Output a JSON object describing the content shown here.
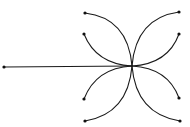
{
  "diagram": {
    "width": 190,
    "height": 127,
    "background": "#ffffff",
    "stroke_color": "#1a1a1a",
    "node_color": "#111111",
    "center": {
      "x": 132,
      "y": 66
    },
    "stem": {
      "from": {
        "x": 4,
        "y": 67
      },
      "to": {
        "x": 132,
        "y": 66
      }
    },
    "arcs": [
      {
        "id": "top-left-outer",
        "end": {
          "x": 85,
          "y": 13
        },
        "ctrl": {
          "x": 128,
          "y": 18
        }
      },
      {
        "id": "top-left-inner",
        "end": {
          "x": 84,
          "y": 34
        },
        "ctrl": {
          "x": 96,
          "y": 64
        }
      },
      {
        "id": "top-right-outer",
        "end": {
          "x": 179,
          "y": 12
        },
        "ctrl": {
          "x": 136,
          "y": 18
        }
      },
      {
        "id": "top-right-inner",
        "end": {
          "x": 179,
          "y": 34
        },
        "ctrl": {
          "x": 168,
          "y": 64
        }
      },
      {
        "id": "bottom-left-inner",
        "end": {
          "x": 84,
          "y": 99
        },
        "ctrl": {
          "x": 96,
          "y": 68
        }
      },
      {
        "id": "bottom-left-outer",
        "end": {
          "x": 85,
          "y": 121
        },
        "ctrl": {
          "x": 128,
          "y": 114
        }
      },
      {
        "id": "bottom-right-inner",
        "end": {
          "x": 179,
          "y": 98
        },
        "ctrl": {
          "x": 168,
          "y": 68
        }
      },
      {
        "id": "bottom-right-outer",
        "end": {
          "x": 180,
          "y": 121
        },
        "ctrl": {
          "x": 136,
          "y": 114
        }
      }
    ],
    "node_radius": 1.6
  }
}
